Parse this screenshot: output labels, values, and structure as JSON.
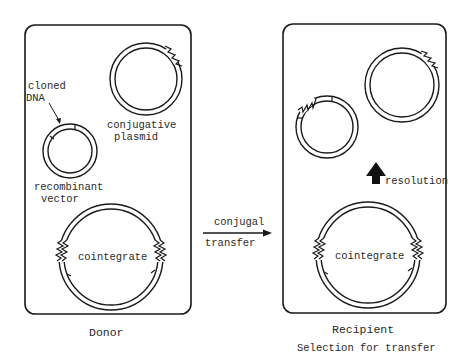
{
  "figure": {
    "type": "conjugal transfer diagram",
    "colors": {
      "line": "#1a1a1a",
      "text": "#2a2a2a",
      "background": "#ffffff"
    }
  },
  "donor": {
    "label": "Donor",
    "elements": {
      "cloned_dna_label_line1": "cloned",
      "cloned_dna_label_line2": "DNA",
      "conjugative_plasmid_line1": "conjugative",
      "conjugative_plasmid_line2": "plasmid",
      "recombinant_vector_line1": "recombinant",
      "recombinant_vector_line2": "vector",
      "cointegrate": "cointegrate"
    }
  },
  "transfer_arrow": {
    "label_top": "conjugal",
    "label_bottom": "transfer",
    "icon": "arrow-right-icon"
  },
  "recipient": {
    "label": "Recipient",
    "caption": "Selection for transfer",
    "resolution_label": "resolution",
    "resolution_icon": "arrow-up-icon",
    "cointegrate": "cointegrate"
  }
}
